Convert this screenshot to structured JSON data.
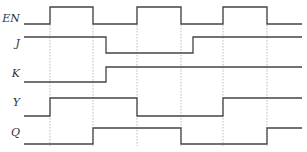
{
  "diagram": {
    "type": "timing-diagram",
    "signals": [
      {
        "name": "EN",
        "label_y": 13
      },
      {
        "name": "J",
        "label_y": 38
      },
      {
        "name": "K",
        "label_y": 68
      },
      {
        "name": "Y",
        "label_y": 97
      },
      {
        "name": "Q",
        "label_y": 127
      }
    ],
    "edge_times_x": [
      50,
      93,
      137,
      181,
      223,
      267
    ],
    "x_start": 24,
    "x_end": 302,
    "colors": {
      "waveform": "#444444",
      "guide": "#aaaaaa",
      "label": "#333333"
    },
    "waveforms": {
      "EN": "24,24 50,24 50,7 93,7 93,24 137,24 137,7 181,7 181,24 223,24 223,7 267,7 267,24 302,24",
      "J": "24,37 106,37 106,53 193,53 193,37 302,37",
      "K": "24,82 106,82 106,67 302,67",
      "Y": "24,116 50,116 50,98 137,98 137,116 223,116 223,98 302,98",
      "Q": "24,144 93,144 93,128 181,128 181,144 267,144 267,128 302,128"
    }
  }
}
